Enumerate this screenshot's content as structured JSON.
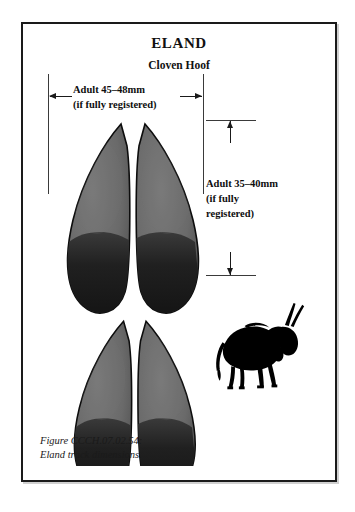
{
  "figure": {
    "title": "ELAND",
    "subtitle": "Cloven Hoof",
    "caption_line1": "Figure  CCCH.07.02.54:",
    "caption_line2": "Eland track dimensions.",
    "frame_color": "#1a1a1a",
    "background": "#ffffff"
  },
  "dimensions": {
    "width_measure": {
      "line1": "Adult 45–48mm",
      "line2": "(if fully registered)",
      "value_min_mm": 45,
      "value_max_mm": 48,
      "orientation": "horizontal",
      "axis": "width"
    },
    "length_measure": {
      "line1": "Adult 35–40mm",
      "line2": "(if fully",
      "line3": "registered)",
      "value_min_mm": 35,
      "value_max_mm": 40,
      "orientation": "vertical",
      "axis": "length"
    }
  },
  "track": {
    "animal": "Eland",
    "hoof_type": "Cloven Hoof",
    "print_count": 4,
    "pairs": [
      {
        "name": "upper-pair",
        "position": "top"
      },
      {
        "name": "lower-pair",
        "position": "bottom"
      }
    ],
    "colors": {
      "hoof_fill": "#6a6a6a",
      "hoof_shadow": "#1c1c1c",
      "hoof_outline": "#111111",
      "silhouette": "#000000"
    }
  },
  "silhouette": {
    "label": "eland-antelope-silhouette",
    "facing": "right"
  }
}
